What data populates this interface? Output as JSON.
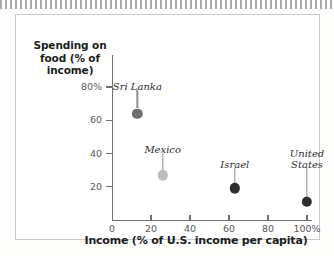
{
  "figure": {
    "frame_border_color": "#c9c9c9",
    "background": "#ffffff"
  },
  "chart_data": {
    "type": "scatter",
    "title": "",
    "xlabel": "Income (% of U.S. income per capita)",
    "ylabel": "Spending on food  (% of income)",
    "ylabel_lines": [
      "Spending on",
      "food  (% of",
      "income)"
    ],
    "xlim": [
      0,
      105
    ],
    "ylim": [
      0,
      90
    ],
    "grid": false,
    "legend": "none",
    "x_ticks": [
      {
        "value": 0,
        "label": "0"
      },
      {
        "value": 20,
        "label": "20"
      },
      {
        "value": 40,
        "label": "40"
      },
      {
        "value": 60,
        "label": "60"
      },
      {
        "value": 80,
        "label": "80"
      },
      {
        "value": 100,
        "label": "100%"
      }
    ],
    "y_ticks": [
      {
        "value": 20,
        "label": "20"
      },
      {
        "value": 40,
        "label": "40"
      },
      {
        "value": 60,
        "label": "60"
      },
      {
        "value": 80,
        "label": "80%"
      }
    ],
    "points": [
      {
        "label": "Sri Lanka",
        "label_lines": [
          "Sri Lanka"
        ],
        "x": 13,
        "y": 64,
        "color": "#6e6e6e",
        "radius": 5.2,
        "label_x": 13,
        "label_y": 80
      },
      {
        "label": "Mexico",
        "label_lines": [
          "Mexico"
        ],
        "x": 26,
        "y": 27,
        "color": "#bdbdbd",
        "radius": 5.2,
        "label_x": 26,
        "label_y": 42
      },
      {
        "label": "Israel",
        "label_lines": [
          "Israel"
        ],
        "x": 63,
        "y": 19,
        "color": "#2e2e2e",
        "radius": 5.2,
        "label_x": 63,
        "label_y": 33
      },
      {
        "label": "United States",
        "label_lines": [
          "United",
          "States"
        ],
        "x": 100,
        "y": 11,
        "color": "#2e2e2e",
        "radius": 5.2,
        "label_x": 100,
        "label_y": 33
      }
    ]
  }
}
